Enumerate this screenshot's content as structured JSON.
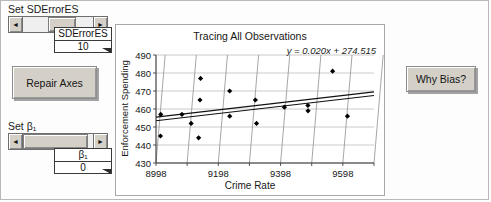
{
  "controls": {
    "sderror_label": "Set SDErrorES",
    "sderror_readout_title": "SDErrorES",
    "sderror_readout_value": "10",
    "beta_label": "Set β₁",
    "beta_readout_title": "β₁",
    "beta_readout_value": "0",
    "repair_axes_label": "Repair Axes",
    "why_bias_label": "Why Bias?",
    "arrow_left": "◄",
    "arrow_right": "►"
  },
  "chart_data": {
    "type": "scatter",
    "title": "Tracing All Observations",
    "xlabel": "Crime Rate",
    "ylabel": "Enforcement Spending",
    "annotation": "y = 0.020x + 274.515",
    "xlim": [
      8998,
      9698
    ],
    "ylim": [
      430,
      490
    ],
    "xticks": [
      8998,
      9198,
      9398,
      9598
    ],
    "yticks": [
      430,
      440,
      450,
      460,
      470,
      480,
      490
    ],
    "grid": true,
    "legend": false,
    "points": [
      {
        "x": 9000,
        "y": 457
      },
      {
        "x": 9005,
        "y": 445
      },
      {
        "x": 9068,
        "y": 457
      },
      {
        "x": 9100,
        "y": 452
      },
      {
        "x": 9118,
        "y": 477
      },
      {
        "x": 9122,
        "y": 465
      },
      {
        "x": 9128,
        "y": 444
      },
      {
        "x": 9215,
        "y": 470
      },
      {
        "x": 9222,
        "y": 456
      },
      {
        "x": 9300,
        "y": 465
      },
      {
        "x": 9310,
        "y": 452
      },
      {
        "x": 9395,
        "y": 461
      },
      {
        "x": 9470,
        "y": 462
      },
      {
        "x": 9472,
        "y": 459
      },
      {
        "x": 9540,
        "y": 481
      },
      {
        "x": 9600,
        "y": 456
      }
    ],
    "lines": [
      {
        "name": "fit-upper",
        "x0": 8998,
        "y0": 455.5,
        "x1": 9698,
        "y1": 469.5
      },
      {
        "name": "fit-lower",
        "x0": 8998,
        "y0": 453.5,
        "x1": 9698,
        "y1": 467.5
      }
    ]
  }
}
